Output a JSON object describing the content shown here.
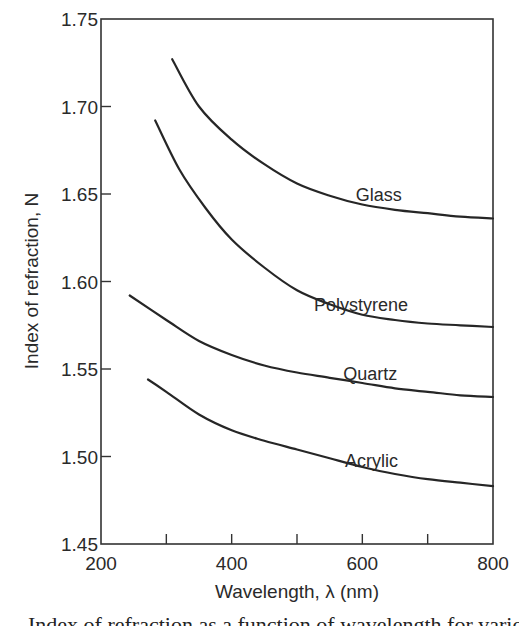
{
  "chart_data": {
    "type": "line",
    "title": "",
    "xlabel": "Wavelength, λ (nm)",
    "ylabel": "Index of refraction, N",
    "xlim": [
      200,
      800
    ],
    "ylim": [
      1.45,
      1.75
    ],
    "grid": false,
    "legend": "inline labels at right end of each curve",
    "x_ticks": [
      200,
      400,
      600,
      800
    ],
    "x_minor_ticks": [
      300,
      500,
      700
    ],
    "x_tick_labels": [
      "200",
      "400",
      "600",
      "800"
    ],
    "y_ticks": [
      1.45,
      1.5,
      1.55,
      1.6,
      1.65,
      1.7,
      1.75
    ],
    "y_tick_labels": [
      "1.45",
      "1.50",
      "1.55",
      "1.60",
      "1.65",
      "1.70",
      "1.75"
    ],
    "series": [
      {
        "name": "Glass",
        "x": [
          309,
          350,
          400,
          450,
          500,
          550,
          600,
          650,
          700,
          750,
          800
        ],
        "values": [
          1.727,
          1.7,
          1.681,
          1.667,
          1.656,
          1.649,
          1.644,
          1.641,
          1.639,
          1.637,
          1.636
        ],
        "label_pos": {
          "x": 625,
          "y": 1.646
        }
      },
      {
        "name": "Polystyrene",
        "x": [
          283,
          320,
          360,
          400,
          450,
          500,
          550,
          600,
          650,
          700,
          750,
          800
        ],
        "values": [
          1.692,
          1.664,
          1.642,
          1.624,
          1.608,
          1.595,
          1.587,
          1.581,
          1.578,
          1.576,
          1.575,
          1.574
        ],
        "label_pos": {
          "x": 598,
          "y": 1.583
        }
      },
      {
        "name": "Quartz",
        "x": [
          244,
          300,
          350,
          400,
          450,
          500,
          550,
          600,
          650,
          700,
          750,
          800
        ],
        "values": [
          1.592,
          1.578,
          1.566,
          1.558,
          1.552,
          1.548,
          1.545,
          1.542,
          1.539,
          1.537,
          1.535,
          1.534
        ],
        "label_pos": {
          "x": 612,
          "y": 1.544
        }
      },
      {
        "name": "Acrylic",
        "x": [
          272,
          300,
          350,
          400,
          450,
          500,
          550,
          600,
          650,
          700,
          750,
          800
        ],
        "values": [
          1.544,
          1.537,
          1.524,
          1.515,
          1.509,
          1.504,
          1.499,
          1.494,
          1.49,
          1.487,
          1.485,
          1.483
        ],
        "label_pos": {
          "x": 614,
          "y": 1.494
        }
      }
    ]
  },
  "caption": "Index of refraction as a function of wavelength for various materials."
}
